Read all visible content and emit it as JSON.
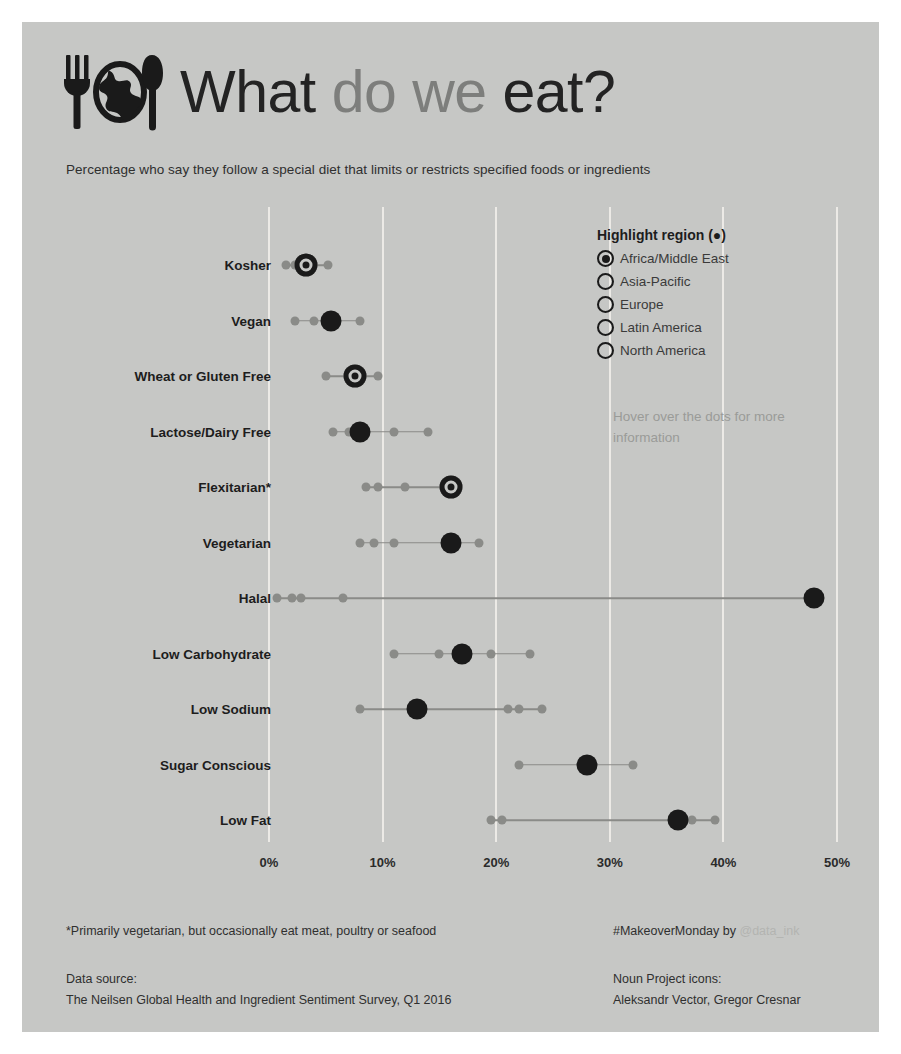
{
  "header": {
    "title_part1": "What",
    "title_part2": "do we",
    "title_part3": "eat?",
    "logo_icon": "fork-globe-knife-icon",
    "subtitle": "Percentage who say they follow a special diet that limits or restricts specified foods or ingredients"
  },
  "legend": {
    "title": "Highlight region (●)",
    "options": [
      {
        "label": "Africa/Middle East",
        "selected": true
      },
      {
        "label": "Asia-Pacific",
        "selected": false
      },
      {
        "label": "Europe",
        "selected": false
      },
      {
        "label": "Latin America",
        "selected": false
      },
      {
        "label": "North America",
        "selected": false
      }
    ]
  },
  "hover_hint": "Hover over the dots for more information",
  "footer": {
    "footnote": "*Primarily vegetarian, but occasionally eat meat, poultry or seafood",
    "hashtag": "#MakeoverMonday by ",
    "handle": "@data_ink",
    "source_label": "Data source:",
    "source_value": "The Neilsen Global Health and Ingredient Sentiment Survey, Q1 2016",
    "credit_label": "Noun Project icons:",
    "credit_value": "Aleksandr Vector, Gregor Cresnar"
  },
  "colors": {
    "canvas": "#c6c7c5",
    "highlight_dot": "#1a1a1a",
    "other_dot": "#8a8b88",
    "gridline": "#eceae6",
    "text_dark": "#1d1d1d",
    "text_gray": "#7d7e7c"
  },
  "chart_data": {
    "type": "scatter",
    "title": "What do we eat?",
    "subtitle": "Percentage who say they follow a special diet that limits or restricts specified foods or ingredients",
    "xlabel": "",
    "ylabel": "",
    "xlim": [
      0,
      52
    ],
    "xticks": [
      0,
      10,
      20,
      30,
      40,
      50
    ],
    "xticklabels": [
      "0%",
      "10%",
      "20%",
      "30%",
      "40%",
      "50%"
    ],
    "grid": true,
    "legend_position": "top-right",
    "highlight_series": "Africa/Middle East",
    "regions": [
      "Africa/Middle East",
      "Asia-Pacific",
      "Europe",
      "Latin America",
      "North America"
    ],
    "categories": [
      "Kosher",
      "Vegan",
      "Wheat or Gluten Free",
      "Lactose/Dairy Free",
      "Flexitarian*",
      "Vegetarian",
      "Halal",
      "Low Carbohydrate",
      "Low Sodium",
      "Sugar Conscious",
      "Low Fat"
    ],
    "rows": [
      {
        "category": "Kosher",
        "highlight": 3.3,
        "ring": true,
        "others": [
          1.5,
          2.3,
          5.2
        ]
      },
      {
        "category": "Vegan",
        "highlight": 5.5,
        "ring": false,
        "others": [
          2.3,
          4.0,
          8.0
        ]
      },
      {
        "category": "Wheat or Gluten Free",
        "highlight": 7.6,
        "ring": true,
        "others": [
          5.0,
          9.6
        ]
      },
      {
        "category": "Lactose/Dairy Free",
        "highlight": 8.0,
        "ring": false,
        "others": [
          5.6,
          7.0,
          11.0,
          14.0
        ]
      },
      {
        "category": "Flexitarian*",
        "highlight": 16.0,
        "ring": true,
        "others": [
          8.5,
          9.6,
          12.0
        ]
      },
      {
        "category": "Vegetarian",
        "highlight": 16.0,
        "ring": false,
        "others": [
          8.0,
          9.2,
          11.0,
          18.5
        ]
      },
      {
        "category": "Halal",
        "highlight": 48.0,
        "ring": false,
        "others": [
          0.7,
          2.0,
          2.8,
          6.5
        ]
      },
      {
        "category": "Low Carbohydrate",
        "highlight": 17.0,
        "ring": false,
        "others": [
          11.0,
          15.0,
          19.5,
          23.0
        ]
      },
      {
        "category": "Low Sodium",
        "highlight": 13.0,
        "ring": false,
        "others": [
          8.0,
          21.0,
          22.0,
          24.0
        ]
      },
      {
        "category": "Sugar Conscious",
        "highlight": 28.0,
        "ring": false,
        "others": [
          22.0,
          32.0
        ]
      },
      {
        "category": "Low Fat",
        "highlight": 36.0,
        "ring": false,
        "others": [
          19.5,
          20.5,
          37.2,
          39.3
        ]
      }
    ]
  }
}
